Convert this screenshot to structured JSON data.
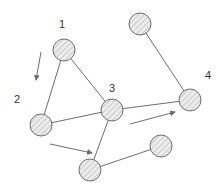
{
  "diagram": {
    "title": "",
    "colors": {
      "stroke": "#6e6e6e",
      "fill": "#e8e8e8",
      "hatch": "#bdbdbd",
      "background": "#ffffff"
    },
    "nodes": [
      {
        "id": "n1",
        "label": "1",
        "cx": 64,
        "cy": 50,
        "r": 11,
        "label_x": 62,
        "label_y": 28
      },
      {
        "id": "n2",
        "label": "2",
        "cx": 41,
        "cy": 125,
        "r": 11,
        "label_x": 17,
        "label_y": 103
      },
      {
        "id": "n3",
        "label": "3",
        "cx": 112,
        "cy": 110,
        "r": 11,
        "label_x": 112,
        "label_y": 92
      },
      {
        "id": "n_top",
        "label": "",
        "cx": 140,
        "cy": 24,
        "r": 11
      },
      {
        "id": "n4",
        "label": "4",
        "cx": 190,
        "cy": 100,
        "r": 11,
        "label_x": 208,
        "label_y": 79
      },
      {
        "id": "n_bottom_left",
        "label": "",
        "cx": 90,
        "cy": 170,
        "r": 11
      },
      {
        "id": "n_bottom_right",
        "label": "",
        "cx": 161,
        "cy": 146,
        "r": 11
      }
    ],
    "edges": [
      {
        "from": "n1",
        "to": "n2"
      },
      {
        "from": "n1",
        "to": "n3"
      },
      {
        "from": "n2",
        "to": "n3"
      },
      {
        "from": "n3",
        "to": "n4"
      },
      {
        "from": "n_top",
        "to": "n4"
      },
      {
        "from": "n3",
        "to": "n_bottom_left"
      },
      {
        "from": "n_bottom_left",
        "to": "n_bottom_right"
      }
    ],
    "arrows": [
      {
        "id": "arrow-1-to-2",
        "x1": 41,
        "y1": 52,
        "x2": 36,
        "y2": 80
      },
      {
        "id": "arrow-2-to-3",
        "x1": 50,
        "y1": 144,
        "x2": 92,
        "y2": 153
      },
      {
        "id": "arrow-3-to-4",
        "x1": 130,
        "y1": 124,
        "x2": 175,
        "y2": 112
      }
    ]
  }
}
